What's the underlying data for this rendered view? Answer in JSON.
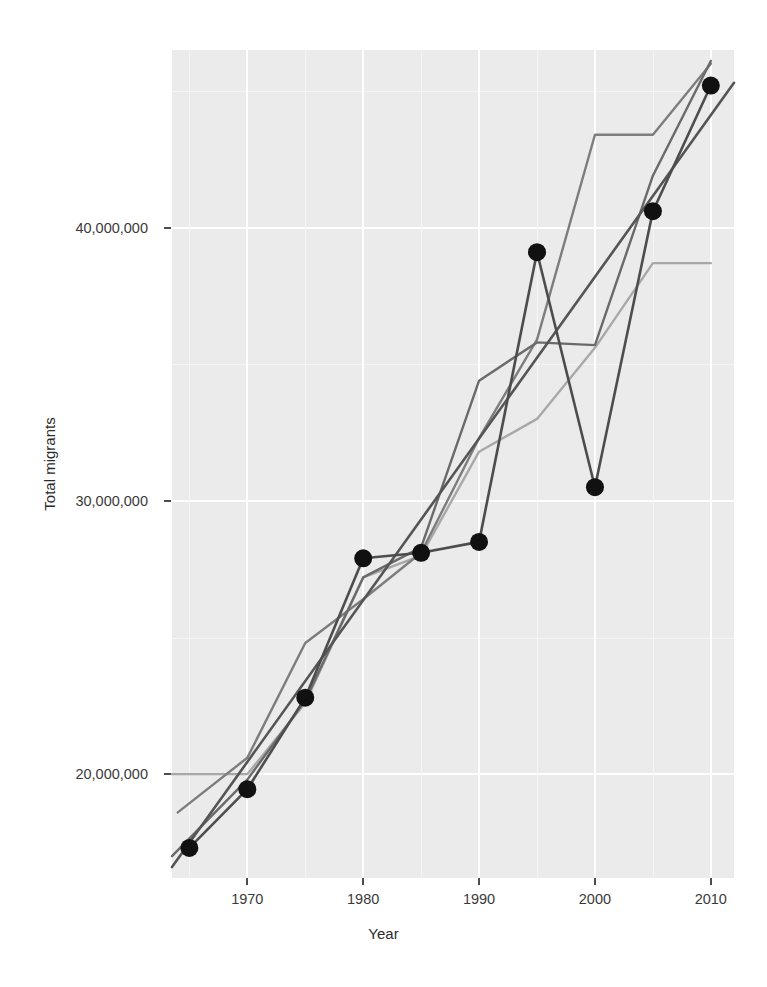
{
  "figure": {
    "background": "#ffffff",
    "panel_background": "#ebebeb",
    "grid_color": "#ffffff",
    "width": 767,
    "height": 987
  },
  "axes": {
    "x_title": "Year",
    "y_title": "Total migrants",
    "x_ticks": [
      "1970",
      "1980",
      "1990",
      "2000",
      "2010"
    ],
    "x_tick_values": [
      1970,
      1980,
      1990,
      2000,
      2010
    ],
    "y_ticks": [
      "20,000,000",
      "30,000,000",
      "40,000,000"
    ],
    "y_tick_values": [
      20000000,
      30000000,
      40000000
    ],
    "x_range": [
      1963.5,
      2012.0
    ],
    "y_range": [
      16200000,
      46500000
    ],
    "grid": "major and minor white gridlines on grey panel"
  },
  "chart_data": {
    "type": "line",
    "title": "",
    "subtitle": "",
    "xlabel": "Year",
    "ylabel": "Total migrants",
    "xlim": [
      1963.5,
      2012.0
    ],
    "ylim": [
      16200000,
      46500000
    ],
    "grid": true,
    "legend": "none",
    "x": [
      1965,
      1970,
      1975,
      1980,
      1985,
      1990,
      1995,
      2000,
      2005,
      2010
    ],
    "series": [
      {
        "name": "Reported total (points)",
        "color": "#4d4d4d",
        "marker": "filled-circle",
        "marker_color": "#111111",
        "marker_size": 9,
        "line_width": 2.6,
        "x": [
          1965,
          1970,
          1975,
          1980,
          1985,
          1990,
          1995,
          2000,
          2005,
          2010
        ],
        "values": [
          17300000,
          19450000,
          22800000,
          27900000,
          28100000,
          28500000,
          39100000,
          30500000,
          40600000,
          45200000
        ]
      },
      {
        "name": "Trend line (dark)",
        "color": "#555555",
        "marker": "none",
        "line_width": 2.6,
        "x": [
          1963.5,
          2012.0
        ],
        "values": [
          16600000,
          45300000
        ]
      },
      {
        "name": "Estimate series A (medium grey)",
        "color": "#7d7d7d",
        "marker": "none",
        "line_width": 2.4,
        "x": [
          1964.0,
          1970,
          1975,
          1980,
          1985,
          1990,
          1995,
          2000,
          2005,
          2010
        ],
        "values": [
          18600000,
          20600000,
          24800000,
          26400000,
          28100000,
          32300000,
          35900000,
          43400000,
          43400000,
          46000000
        ]
      },
      {
        "name": "Estimate series B (light grey)",
        "color": "#a8a8a8",
        "marker": "none",
        "line_width": 2.4,
        "x": [
          1963.5,
          1970,
          1975,
          1980,
          1985,
          1990,
          1995,
          2000,
          2005,
          2010
        ],
        "values": [
          20000000,
          20000000,
          22600000,
          27200000,
          28000000,
          31800000,
          33000000,
          35600000,
          38700000,
          38700000
        ]
      },
      {
        "name": "Estimate series C (mid-dark grey)",
        "color": "#6a6a6a",
        "marker": "none",
        "line_width": 2.4,
        "x": [
          1963.5,
          1970,
          1975,
          1980,
          1985,
          1990,
          1995,
          2000,
          2005,
          2010
        ],
        "values": [
          17000000,
          19800000,
          22700000,
          27200000,
          28300000,
          34400000,
          35800000,
          35700000,
          41900000,
          46100000
        ]
      }
    ],
    "annotations": []
  }
}
